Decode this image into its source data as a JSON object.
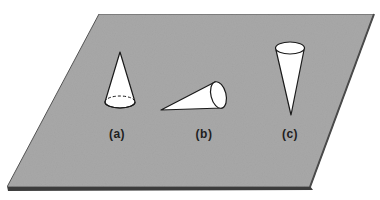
{
  "figure": {
    "plane": {
      "color": "#a9a9a9",
      "edge_color": "#4a4a4a",
      "corners": [
        [
          99,
          14
        ],
        [
          374,
          14
        ],
        [
          310,
          188
        ],
        [
          7,
          188
        ]
      ]
    },
    "cones": [
      {
        "id": "a",
        "label": "(a)",
        "orientation": "standing on base, apex up",
        "label_pos": [
          117,
          127
        ]
      },
      {
        "id": "b",
        "label": "(b)",
        "orientation": "lying on side",
        "label_pos": [
          204,
          127
        ]
      },
      {
        "id": "c",
        "label": "(c)",
        "orientation": "balanced on apex, base up",
        "label_pos": [
          290,
          127
        ]
      }
    ]
  }
}
